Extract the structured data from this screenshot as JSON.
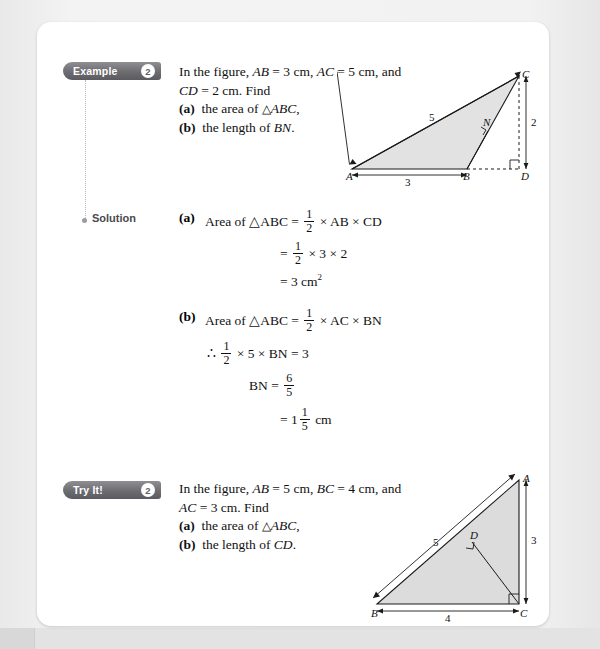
{
  "page": {
    "background_color": "#efefef",
    "sheet_color": "#ffffff"
  },
  "example_block": {
    "tab_label": "Example",
    "tab_number": "2",
    "question_lines": [
      "In the figure, AB = 3 cm, AC = 5 cm, and",
      "CD = 2 cm. Find"
    ],
    "items": [
      {
        "tag": "(a)",
        "text": "the area of △ABC,"
      },
      {
        "tag": "(b)",
        "text": "the length of BN."
      }
    ],
    "figure": {
      "name": "triangle-abc-with-altitudes",
      "vertex_labels": [
        "A",
        "B",
        "C",
        "D",
        "N"
      ],
      "side_lengths": {
        "AB": "3",
        "AC": "5",
        "CD": "2"
      }
    }
  },
  "solution_block": {
    "label": "Solution",
    "part_a": {
      "tag": "(a)",
      "line1_prefix": "Area of △ABC =",
      "line1_frac": {
        "num": "1",
        "den": "2"
      },
      "line1_suffix": "× AB × CD",
      "line2_frac": {
        "num": "1",
        "den": "2"
      },
      "line2_suffix": "× 3 × 2",
      "line3": "= 3 cm",
      "line3_sup": "2"
    },
    "part_b": {
      "tag": "(b)",
      "line1_prefix": "Area of △ABC =",
      "line1_frac": {
        "num": "1",
        "den": "2"
      },
      "line1_suffix": "× AC × BN",
      "line2_therefore": "∴",
      "line2_frac": {
        "num": "1",
        "den": "2"
      },
      "line2_suffix": "× 5 × BN = 3",
      "line3_prefix": "BN =",
      "line3_frac": {
        "num": "6",
        "den": "5"
      },
      "line4_prefix": "= 1",
      "line4_frac": {
        "num": "1",
        "den": "5"
      },
      "line4_suffix": "cm"
    }
  },
  "tryit_block": {
    "tab_label": "Try It!",
    "tab_number": "2",
    "question_lines": [
      "In the figure, AB = 5 cm, BC = 4 cm, and",
      "AC = 3 cm. Find"
    ],
    "items": [
      {
        "tag": "(a)",
        "text": "the area of △ABC,"
      },
      {
        "tag": "(b)",
        "text": "the length of CD."
      }
    ],
    "figure": {
      "name": "right-triangle-abc-with-altitude",
      "vertex_labels": [
        "A",
        "B",
        "C",
        "D"
      ],
      "side_lengths": {
        "AB": "5",
        "BC": "4",
        "AC": "3"
      }
    }
  }
}
